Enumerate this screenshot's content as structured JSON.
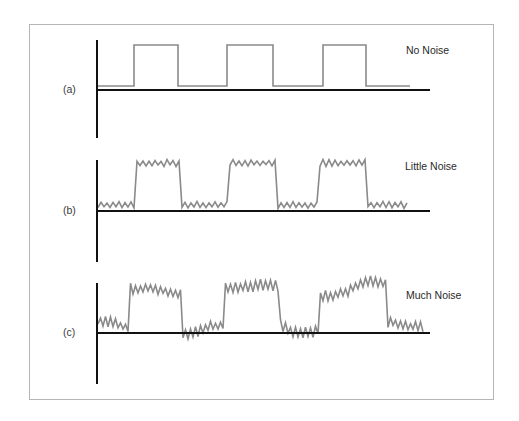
{
  "figure": {
    "border_color": "#b5b5b5",
    "axis_color": "#111111",
    "trace_color": "#8a8a8a",
    "panels": [
      {
        "id": "a",
        "tag": "(a)",
        "label": "No Noise",
        "noise_level": "none",
        "axis": {
          "x0": 97,
          "y_top": 40,
          "y_bottom": 138,
          "baseline": 90,
          "x_end": 430
        },
        "trace": {
          "x_start": 98,
          "x_end": 410,
          "low": 86,
          "high": 45,
          "edges": [
            134,
            178,
            227,
            273,
            323,
            366
          ],
          "noise_amp": 0,
          "drift": 0
        },
        "tag_pos": {
          "x": 63,
          "y": 83
        },
        "label_pos": {
          "x": 406,
          "y": 44
        }
      },
      {
        "id": "b",
        "tag": "(b)",
        "label": "Little Noise",
        "noise_level": "little",
        "axis": {
          "x0": 97,
          "y_top": 160,
          "y_bottom": 262,
          "baseline": 211,
          "x_end": 430
        },
        "trace": {
          "x_start": 98,
          "x_end": 407,
          "low": 205,
          "high": 163,
          "edges": [
            136,
            182,
            228,
            276,
            320,
            366
          ],
          "noise_amp": 3,
          "drift": 0
        },
        "tag_pos": {
          "x": 63,
          "y": 204
        },
        "label_pos": {
          "x": 405,
          "y": 160
        }
      },
      {
        "id": "c",
        "tag": "(c)",
        "label": "Much Noise",
        "noise_level": "much",
        "axis": {
          "x0": 97,
          "y_top": 283,
          "y_bottom": 384,
          "baseline": 333,
          "x_end": 430
        },
        "trace": {
          "x_start": 98,
          "x_end": 425,
          "low": 328,
          "high": 289,
          "edges": [
            130,
            182,
            225,
            280,
            320,
            388
          ],
          "noise_amp": 5,
          "drift": 1
        },
        "tag_pos": {
          "x": 63,
          "y": 326
        },
        "label_pos": {
          "x": 406,
          "y": 289
        }
      }
    ]
  }
}
